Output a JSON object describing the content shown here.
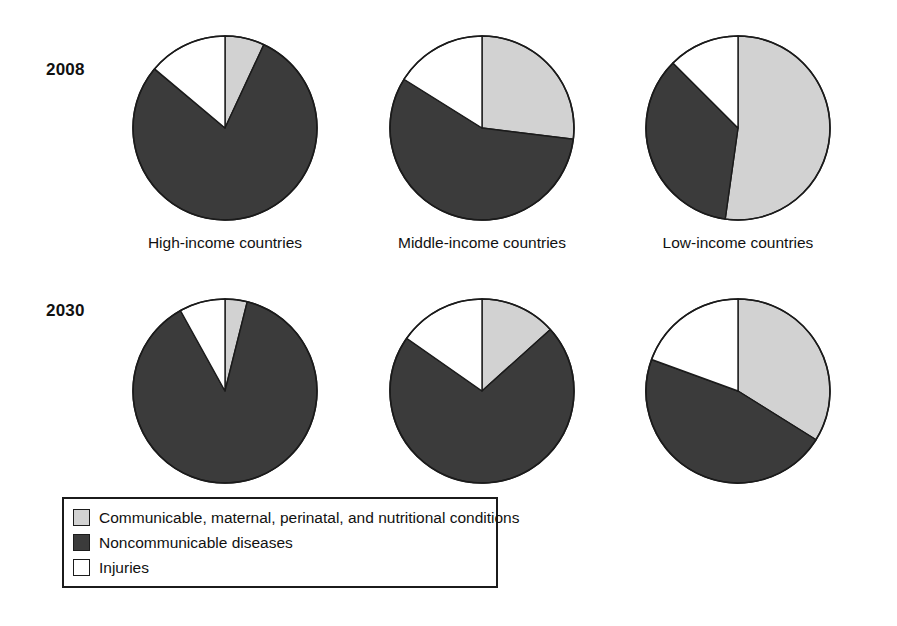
{
  "figure": {
    "row_labels": [
      "2008",
      "2030"
    ],
    "column_labels": [
      "High-income countries",
      "Middle-income countries",
      "Low-income countries"
    ]
  },
  "legend": {
    "items": [
      {
        "label": "Communicable, maternal, perinatal, and nutritional conditions",
        "color": "#d2d2d2"
      },
      {
        "label": "Noncommunicable diseases",
        "color": "#3b3b3b"
      },
      {
        "label": "Injuries",
        "color": "#ffffff"
      }
    ]
  },
  "colors": {
    "communicable": "#d2d2d2",
    "noncommunicable": "#3b3b3b",
    "injuries": "#ffffff",
    "outline": "#1b1b1b",
    "text": "#111111"
  },
  "chart_data": {
    "type": "pie",
    "title": "",
    "xlabel": "",
    "ylabel": "",
    "legend_position": "bottom-left",
    "grid": false,
    "series_names": [
      "Communicable, maternal, perinatal, and nutritional conditions",
      "Noncommunicable diseases",
      "Injuries"
    ],
    "series_colors": [
      "#d2d2d2",
      "#3b3b3b",
      "#ffffff"
    ],
    "units": "percent of total deaths",
    "start_angle_deg": 0,
    "direction": "clockwise",
    "rows": [
      "2008",
      "2030"
    ],
    "columns": [
      "High-income countries",
      "Middle-income countries",
      "Low-income countries"
    ],
    "pies": [
      {
        "id": "2008-high-income",
        "row": "2008",
        "column": "High-income countries",
        "cx": 225,
        "cy": 128,
        "r": 94,
        "values": [
          7,
          79,
          14
        ],
        "angles_deg": [
          25,
          285,
          50
        ]
      },
      {
        "id": "2008-middle-income",
        "row": "2008",
        "column": "Middle-income countries",
        "cx": 482,
        "cy": 128,
        "r": 94,
        "values": [
          27,
          57,
          16
        ],
        "angles_deg": [
          97,
          205,
          58
        ]
      },
      {
        "id": "2008-low-income",
        "row": "2008",
        "column": "Low-income countries",
        "cx": 738,
        "cy": 128,
        "r": 94,
        "values": [
          52,
          35,
          13
        ],
        "angles_deg": [
          188,
          127,
          45
        ]
      },
      {
        "id": "2030-high-income",
        "row": "2030",
        "column": "High-income countries",
        "cx": 225,
        "cy": 391,
        "r": 94,
        "values": [
          4,
          88,
          8
        ],
        "angles_deg": [
          14,
          317,
          29
        ]
      },
      {
        "id": "2030-middle-income",
        "row": "2030",
        "column": "Middle-income countries",
        "cx": 482,
        "cy": 391,
        "r": 94,
        "values": [
          13,
          72,
          15
        ],
        "angles_deg": [
          48,
          257,
          55
        ]
      },
      {
        "id": "2030-low-income",
        "row": "2030",
        "column": "Low-income countries",
        "cx": 738,
        "cy": 391,
        "r": 94,
        "values": [
          34,
          47,
          19
        ],
        "angles_deg": [
          122,
          168,
          70
        ]
      }
    ]
  }
}
